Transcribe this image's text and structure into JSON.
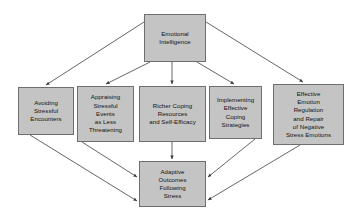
{
  "diagram": {
    "type": "flowchart",
    "title_node": "emotional-intelligence",
    "colors": {
      "node_fill": "#c4c4c4",
      "node_border": "#6e6e6e",
      "edge": "#4a4a4a",
      "text": "#111111",
      "background": "#ffffff"
    },
    "nodes": {
      "emotional_intelligence": {
        "label": "Emotional\nIntelligence",
        "role": "root"
      },
      "avoiding_stressful_encounters": {
        "label": "Avoiding\nStressful\nEncounters",
        "role": "mediator"
      },
      "appraising_stressful_events": {
        "label": "Appraising\nStressful\nEvents\nas Less\nThreatening",
        "role": "mediator"
      },
      "richer_coping_resources": {
        "label": "Richer Coping\nResources\nand Self-Efficacy",
        "role": "mediator"
      },
      "implementing_effective_coping": {
        "label": "Implementing\nEffective\nCoping\nStrategies",
        "role": "mediator"
      },
      "effective_emotion_regulation": {
        "label": "Effective\nEmotion\nRegulation\nand Repair\nof Negative\nStress Emotions",
        "role": "mediator"
      },
      "adaptive_outcomes": {
        "label": "Adaptive\nOutcomes\nFollowing\nStress",
        "role": "outcome"
      }
    },
    "edges": [
      {
        "from": "emotional_intelligence",
        "to": "avoiding_stressful_encounters"
      },
      {
        "from": "emotional_intelligence",
        "to": "appraising_stressful_events"
      },
      {
        "from": "emotional_intelligence",
        "to": "richer_coping_resources"
      },
      {
        "from": "emotional_intelligence",
        "to": "implementing_effective_coping"
      },
      {
        "from": "emotional_intelligence",
        "to": "effective_emotion_regulation"
      },
      {
        "from": "avoiding_stressful_encounters",
        "to": "adaptive_outcomes"
      },
      {
        "from": "appraising_stressful_events",
        "to": "adaptive_outcomes"
      },
      {
        "from": "richer_coping_resources",
        "to": "adaptive_outcomes"
      },
      {
        "from": "implementing_effective_coping",
        "to": "adaptive_outcomes"
      },
      {
        "from": "effective_emotion_regulation",
        "to": "adaptive_outcomes"
      }
    ]
  }
}
